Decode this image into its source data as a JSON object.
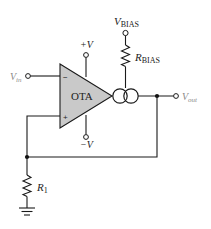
{
  "diagram": {
    "type": "circuit-schematic",
    "colors": {
      "wire": "#1a1a1a",
      "ota_fill": "#c9c9c9",
      "label": "#222222",
      "faded_label": "#8a8a8a"
    },
    "components": {
      "ota": {
        "label": "OTA",
        "inverting_sign": "−",
        "noninverting_sign": "+"
      },
      "current_source": {
        "symbol": "dual-circle"
      },
      "r_bias": {
        "label_main": "R",
        "label_sub": "BIAS"
      },
      "r1": {
        "label_main": "R",
        "label_sub": "1"
      },
      "ground": {
        "symbol": "ground"
      }
    },
    "terminals": {
      "v_in": {
        "label_main": "V",
        "label_sub": "in"
      },
      "v_out": {
        "label_main": "V",
        "label_sub": "out"
      },
      "v_bias": {
        "label_main": "V",
        "label_sub": "BIAS"
      },
      "plus_v": {
        "label": "+V"
      },
      "minus_v": {
        "label": "−V"
      }
    }
  }
}
